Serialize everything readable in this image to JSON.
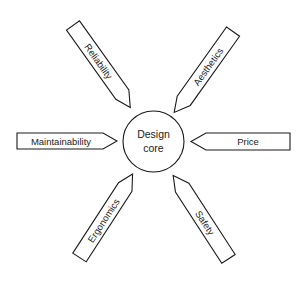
{
  "diagram": {
    "type": "radial-arrows",
    "center": {
      "label_line1": "Design",
      "label_line2": "core"
    },
    "arrows": [
      {
        "label": "Reliability",
        "position": "top-left"
      },
      {
        "label": "Aesthetics",
        "position": "top-right"
      },
      {
        "label": "Maintainability",
        "position": "left"
      },
      {
        "label": "Price",
        "position": "right"
      },
      {
        "label": "Ergonomics",
        "position": "bottom-left"
      },
      {
        "label": "Safety",
        "position": "bottom-right"
      }
    ],
    "colors": {
      "stroke": "#1a1a1a",
      "fill": "#ffffff",
      "text": "#222222"
    }
  }
}
